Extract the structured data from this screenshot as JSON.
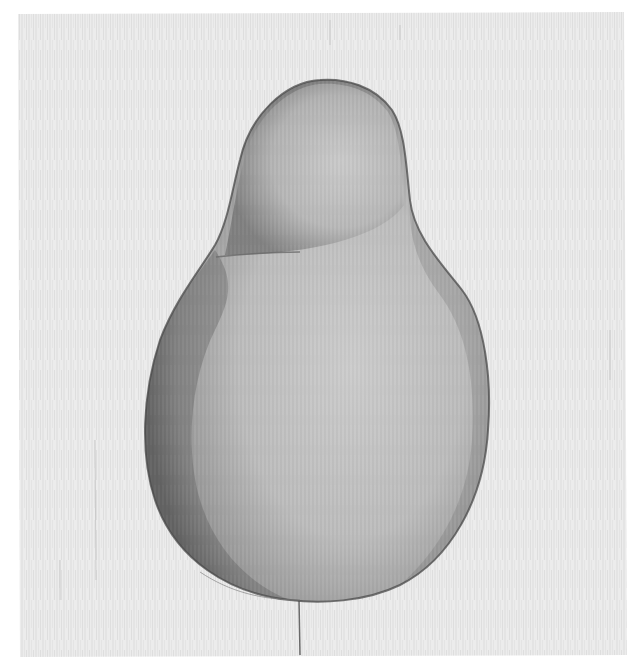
{
  "image": {
    "subject": "Graphite/charcoal drawing of a pear on textured canvas",
    "alt": "Monochrome shaded drawing of a pear with vertical canvas texture"
  },
  "colors": {
    "border": "#ffffff",
    "canvas": "#ebebeb",
    "canvas_texture": "#d4d4d4",
    "pear_light": "#c8c8c8",
    "pear_mid": "#b0b0b0",
    "pear_dark": "#6e6e6e",
    "outline": "#4a4a4a"
  }
}
